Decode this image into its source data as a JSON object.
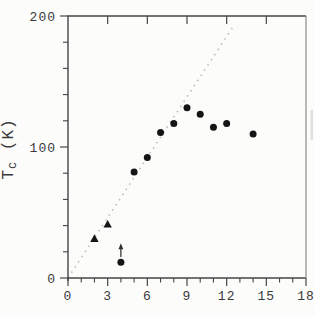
{
  "chart_data": {
    "type": "scatter",
    "ylabel": "Tc (K)",
    "ylabel_parts": {
      "main": "T",
      "sub": "c",
      "rest": " (K)"
    },
    "xlim": [
      0,
      18
    ],
    "ylim": [
      0,
      200
    ],
    "x_major_ticks": [
      0,
      3,
      6,
      9,
      12,
      15,
      18
    ],
    "x_tick_labels": [
      "0",
      "3",
      "6",
      "9",
      "12",
      "15",
      "18"
    ],
    "x_minor_step": 1,
    "y_major_ticks": [
      0,
      100,
      200
    ],
    "y_tick_labels": [
      "0",
      "100",
      "200"
    ],
    "y_minor_step": 20,
    "grid": false,
    "axis_color": "#464646",
    "label_color": "#3a3a3a",
    "series": [
      {
        "name": "circle-points",
        "marker": "circle",
        "color": "#151515",
        "points": [
          [
            4,
            12
          ],
          [
            5,
            81
          ],
          [
            6,
            92
          ],
          [
            7,
            111
          ],
          [
            8,
            118
          ],
          [
            9,
            130
          ],
          [
            10,
            125
          ],
          [
            11,
            115
          ],
          [
            12,
            118
          ],
          [
            14,
            110
          ]
        ]
      },
      {
        "name": "triangle-points",
        "marker": "triangle",
        "color": "#151515",
        "points": [
          [
            2,
            30
          ],
          [
            3,
            41
          ]
        ]
      }
    ],
    "reference_line": {
      "style": "dotted",
      "color": "#bfbfbf",
      "from": [
        0,
        0
      ],
      "to": [
        12.5,
        192
      ]
    },
    "annotations": [
      {
        "type": "arrow",
        "x": 4,
        "y_from": 16,
        "y_to": 26.5,
        "direction": "up",
        "color": "#2e2e2e"
      }
    ]
  }
}
